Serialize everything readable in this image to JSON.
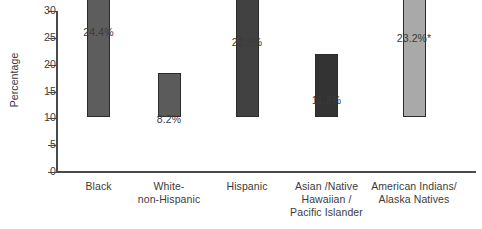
{
  "chart_data": {
    "type": "bar",
    "title": "",
    "xlabel": "",
    "ylabel": "Percentage",
    "ylim": [
      0,
      30
    ],
    "yticks": [
      0,
      5,
      10,
      15,
      20,
      25,
      30
    ],
    "ytick_labels": [
      "0",
      "5",
      "10",
      "15",
      "20",
      "25",
      "30"
    ],
    "grid": false,
    "legend": "none",
    "categories": [
      "Black",
      "White-\nnon-Hispanic",
      "Hispanic",
      "Asian /Native\nHawaiian /\nPacific Islander",
      "American Indians/\nAlaska Natives"
    ],
    "values": [
      24.4,
      8.2,
      22.5,
      11.8,
      23.2
    ],
    "value_labels": [
      "24.4%",
      "8.2%",
      "22.5%",
      "11.8%",
      "23.2%*"
    ],
    "bar_colors": [
      "#5d5d5d",
      "#5b5b5b",
      "#414141",
      "#333333",
      "#a9a9a9"
    ],
    "bar_edge_color": "#2b2b2b",
    "axis_color": "#4a4a4a",
    "text_color": "#3b3b3b",
    "background": "#ffffff",
    "footnote_marker": "*"
  }
}
